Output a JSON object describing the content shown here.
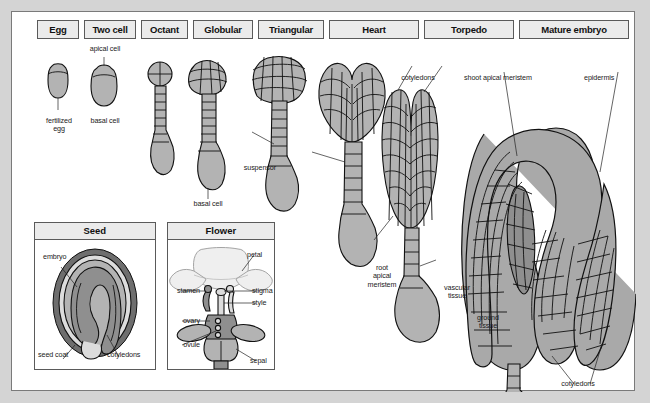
{
  "figure": {
    "background_color": "#d4d4d4",
    "panel_color": "#ffffff",
    "box_fill": "#ebebeb",
    "tissue_color": "#b3b3b3"
  },
  "stages": [
    {
      "label": "Egg",
      "x": 25,
      "width": 42
    },
    {
      "label": "Two cell",
      "x": 72,
      "width": 52
    },
    {
      "label": "Octant",
      "x": 129,
      "width": 47
    },
    {
      "label": "Globular",
      "x": 181,
      "width": 60
    },
    {
      "label": "Triangular",
      "x": 246,
      "width": 66
    },
    {
      "label": "Heart",
      "x": 317,
      "width": 90
    },
    {
      "label": "Torpedo",
      "x": 412,
      "width": 90
    },
    {
      "label": "Mature embryo",
      "x": 507,
      "width": 110
    }
  ],
  "embryo_labels": {
    "fertilized_egg": "fertilized\negg",
    "fertilized_egg_line1": "fertilized",
    "fertilized_egg_line2": "egg",
    "apical_cell": "apical cell",
    "basal_cell": "basal cell",
    "basal_cell_2": "basal cell",
    "suspensor": "suspensor",
    "cotyledons_torpedo": "cotyledons",
    "shoot_apical_meristem": "shoot apical meristem",
    "epidermis": "epidermis",
    "root_apical_meristem_l1": "root",
    "root_apical_meristem_l2": "apical",
    "root_apical_meristem_l3": "meristem",
    "vascular_tissue_l1": "vascular",
    "vascular_tissue_l2": "tissue",
    "ground_tissue_l1": "ground",
    "ground_tissue_l2": "tissue",
    "cotyledons_mature": "cotyledons"
  },
  "seed_panel": {
    "title": "Seed",
    "labels": {
      "embryo": "embryo",
      "seed_coat": "seed coat",
      "cotyledons": "cotyledons"
    }
  },
  "flower_panel": {
    "title": "Flower",
    "labels": {
      "petal": "petal",
      "stigma": "stigma",
      "style": "style",
      "sepal": "sepal",
      "stamen": "stamen",
      "ovary": "ovary",
      "ovule": "ovule"
    }
  }
}
